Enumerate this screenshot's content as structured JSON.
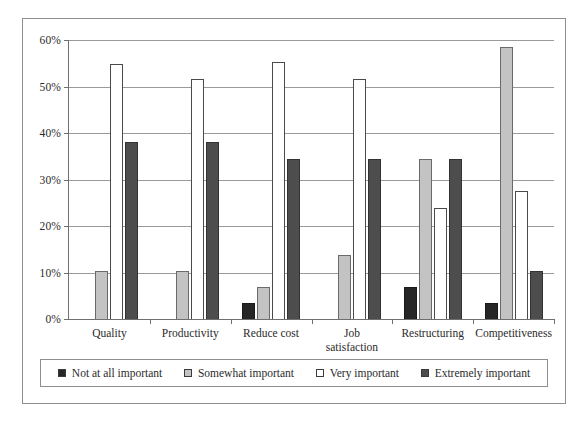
{
  "chart_data": {
    "type": "bar",
    "title": "",
    "subtitle": "",
    "xlabel": "",
    "ylabel": "",
    "ylim": [
      0,
      60
    ],
    "ytick_labels": [
      "0%",
      "10%",
      "20%",
      "30%",
      "40%",
      "50%",
      "60%"
    ],
    "ytick_values": [
      0,
      10,
      20,
      30,
      40,
      50,
      60
    ],
    "grid": true,
    "legend_position": "bottom",
    "categories": [
      "Quality",
      "Productivity",
      "Reduce cost",
      "Job\nsatisfaction",
      "Restructuring",
      "Competitiveness"
    ],
    "series": [
      {
        "name": "Not at all important",
        "color": "#262626",
        "values": [
          0,
          0,
          3.4,
          0,
          6.9,
          3.4
        ]
      },
      {
        "name": "Somewhat important",
        "color": "#c3c3c3",
        "values": [
          10.4,
          10.3,
          6.8,
          13.8,
          34.5,
          58.6
        ]
      },
      {
        "name": "Very important",
        "color": "#ffffff",
        "values": [
          54.8,
          51.7,
          55.2,
          51.7,
          23.8,
          27.5
        ]
      },
      {
        "name": "Extremely important",
        "color": "#4d4d4d",
        "values": [
          38.0,
          38.0,
          34.5,
          34.5,
          34.5,
          10.4
        ]
      }
    ]
  },
  "legend": {
    "items": [
      {
        "label": "Not at all important",
        "swatch": "dark-square-icon"
      },
      {
        "label": "Somewhat important",
        "swatch": "light-gray-square-icon"
      },
      {
        "label": "Very important",
        "swatch": "hollow-square-icon"
      },
      {
        "label": "Extremely important",
        "swatch": "gray-square-icon"
      }
    ]
  },
  "colors": {
    "not_at_all": "#262626",
    "somewhat": "#c3c3c3",
    "very": "#ffffff",
    "extremely": "#4d4d4d",
    "axis": "#6f6f6f",
    "grid": "#9a9a9a",
    "frame": "#8e8e8e",
    "text": "#2b2b2b"
  }
}
